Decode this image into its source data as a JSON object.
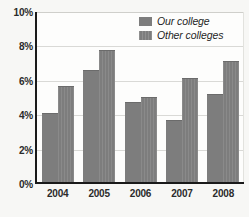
{
  "chart_data": {
    "type": "bar",
    "title": "",
    "subtitle": "",
    "xlabel": "",
    "ylabel": "",
    "categories": [
      "2004",
      "2005",
      "2006",
      "2007",
      "2008"
    ],
    "series": [
      {
        "name": "Our college",
        "values": [
          4.0,
          6.5,
          4.65,
          3.6,
          5.1
        ]
      },
      {
        "name": "Other colleges",
        "values": [
          5.6,
          7.65,
          4.95,
          6.05,
          7.05
        ]
      }
    ],
    "ylim": [
      0,
      10
    ],
    "ytick_values": [
      0,
      2,
      4,
      6,
      8,
      10
    ],
    "ytick_labels": [
      "0%",
      "2%",
      "4%",
      "6%",
      "8%",
      "10%"
    ],
    "grid": true,
    "legend_position": "top-right",
    "colors": {
      "series_our_college": "#7d7d7d",
      "series_other_colleges": "#7d7d7d",
      "axis": "#1a1a1a",
      "gridline": "#d9d9d6",
      "background": "#f7f7f5",
      "plot_background": "#fdfdfc",
      "text": "#2b2b2b"
    }
  },
  "legend": {
    "items": [
      {
        "label": "Our college"
      },
      {
        "label": "Other colleges"
      }
    ]
  }
}
